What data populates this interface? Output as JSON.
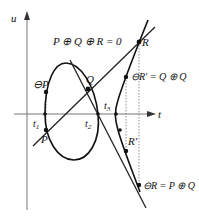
{
  "diagram": {
    "equation": "P ⊕ Q ⊕ R = 0",
    "axes": {
      "x_label": "t",
      "y_label": "u"
    },
    "ticks": [
      {
        "id": "t1",
        "label": "t",
        "sub": "1"
      },
      {
        "id": "t2",
        "label": "t",
        "sub": "2"
      },
      {
        "id": "t3",
        "label": "t",
        "sub": "3"
      }
    ],
    "points": [
      {
        "id": "P",
        "label": "P"
      },
      {
        "id": "negP",
        "label": "⊖P"
      },
      {
        "id": "Q",
        "label": "Q"
      },
      {
        "id": "R",
        "label": "R"
      },
      {
        "id": "Rprime",
        "label": "R′"
      },
      {
        "id": "negRprime",
        "label": "⊖R′ = Q ⊕ Q"
      },
      {
        "id": "negR",
        "label": "⊖R = P ⊕ Q"
      }
    ],
    "colors": {
      "curve": "#111111",
      "axis": "#777777",
      "dashed": "#666666"
    }
  }
}
